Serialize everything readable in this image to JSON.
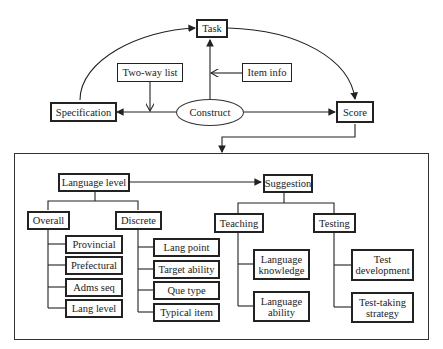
{
  "top": {
    "task": "Task",
    "specification": "Specification",
    "score": "Score",
    "construct": "Construct",
    "two_way_list": "Two-way list",
    "item_info": "Item info"
  },
  "panel": {
    "language_level": "Language  level",
    "overall": "Overall",
    "overall_items": [
      "Provincial",
      "Prefectural",
      "Adms seq",
      "Lang level"
    ],
    "discrete": "Discrete",
    "discrete_items": [
      "Lang point",
      "Target ability",
      "Que type",
      "Typical item"
    ],
    "suggestion": "Suggestion",
    "teaching": "Teaching",
    "teaching_items": [
      "Language\nknowledge",
      "Language\nability"
    ],
    "testing": "Testing",
    "testing_items": [
      "Test\ndevelopment",
      "Test-taking\nstrategy"
    ]
  }
}
